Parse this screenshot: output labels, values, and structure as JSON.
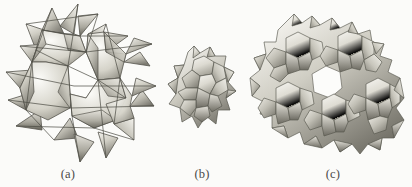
{
  "figure": {
    "background_color": "#fbfbf9",
    "panels": [
      {
        "id": "a",
        "caption": "(a)",
        "subject": "spiky star-polyhedral minimal surface unit",
        "icon": "star-polyhedron-surface-icon"
      },
      {
        "id": "b",
        "caption": "(b)",
        "subject": "single rounded polyhedral cell with hexagonal and pentagonal faces",
        "icon": "single-cell-polyhedron-icon"
      },
      {
        "id": "c",
        "caption": "(c)",
        "subject": "periodic assembly of rounded polyhedral cells with central channel",
        "icon": "cell-assembly-icon"
      }
    ],
    "palette": {
      "surface_light": "#f2f1ec",
      "surface_mid": "#c9c7bd",
      "surface_dark": "#8e8c82",
      "surface_shadow": "#6d6b62",
      "edge_line": "#55544d",
      "caption_color": "#4a4a48"
    }
  }
}
